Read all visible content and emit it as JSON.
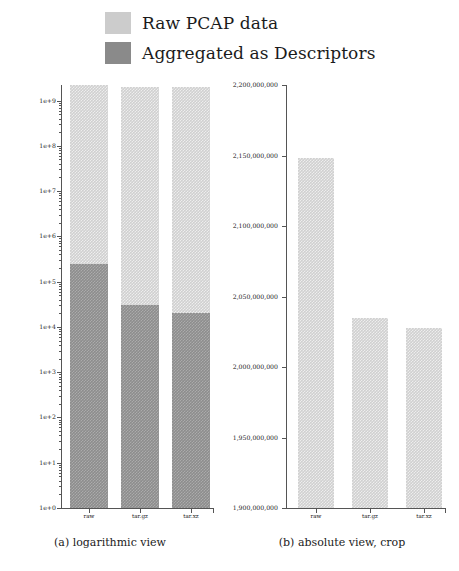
{
  "figure": {
    "legend": {
      "position": "top-center",
      "entries": [
        {
          "label": "Raw PCAP data",
          "color": "#cccccc",
          "icon": "legend-swatch"
        },
        {
          "label": "Aggregated as Descriptors",
          "color": "#8a8a8a",
          "icon": "legend-swatch"
        }
      ]
    },
    "panels": [
      {
        "id": "a",
        "caption": "(a) logarithmic view"
      },
      {
        "id": "b",
        "caption": "(b) absolute view, crop"
      }
    ]
  },
  "chart_data": [
    {
      "type": "bar",
      "id": "logarithmic-view",
      "title": "",
      "caption": "(a) logarithmic view",
      "stacked": true,
      "yscale": "log",
      "xlabel": "",
      "ylabel": "",
      "grid": false,
      "legend_position": "top-center",
      "categories": [
        "raw",
        "tar.gz",
        "tar.xz"
      ],
      "ylim": [
        1,
        2200000000
      ],
      "ytick_labels": [
        "1e+0",
        "1e+1",
        "1e+2",
        "1e+3",
        "1e+4",
        "1e+5",
        "1e+6",
        "1e+7",
        "1e+8",
        "1e+9"
      ],
      "ytick_values": [
        1,
        10,
        100,
        1000,
        10000,
        100000,
        1000000,
        10000000,
        100000000,
        1000000000
      ],
      "minor_ticks": true,
      "series": [
        {
          "name": "Raw PCAP data",
          "color": "#cccccc",
          "values": [
            2148000000,
            2035000000,
            2028000000
          ]
        },
        {
          "name": "Aggregated as Descriptors",
          "color": "#8a8a8a",
          "values": [
            250000,
            30000,
            20000
          ]
        }
      ]
    },
    {
      "type": "bar",
      "id": "absolute-view-crop",
      "title": "",
      "caption": "(b) absolute view, crop",
      "stacked": false,
      "yscale": "linear",
      "xlabel": "",
      "ylabel": "",
      "grid": false,
      "legend_position": "top-center",
      "categories": [
        "raw",
        "tar.gz",
        "tar.xz"
      ],
      "ylim": [
        1900000000,
        2200000000
      ],
      "ytick_labels": [
        "1,900,000,000",
        "1,950,000,000",
        "2,000,000,000",
        "2,050,000,000",
        "2,100,000,000",
        "2,150,000,000",
        "2,200,000,000"
      ],
      "ytick_values": [
        1900000000,
        1950000000,
        2000000000,
        2050000000,
        2100000000,
        2150000000,
        2200000000
      ],
      "minor_ticks": false,
      "series": [
        {
          "name": "Raw PCAP data",
          "color": "#cccccc",
          "values": [
            2148000000,
            2035000000,
            2028000000
          ]
        }
      ]
    }
  ]
}
